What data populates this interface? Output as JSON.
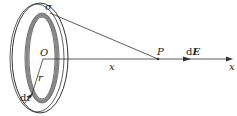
{
  "diagram": {
    "labels": {
      "sigma": "σ",
      "origin": "O",
      "radius": "r",
      "dr": "dr",
      "point": "P",
      "distance": "x",
      "axis": "x",
      "field_d": "d",
      "field_E": "E"
    },
    "colors": {
      "line": "#333333",
      "ring_fill": "#888888"
    }
  }
}
